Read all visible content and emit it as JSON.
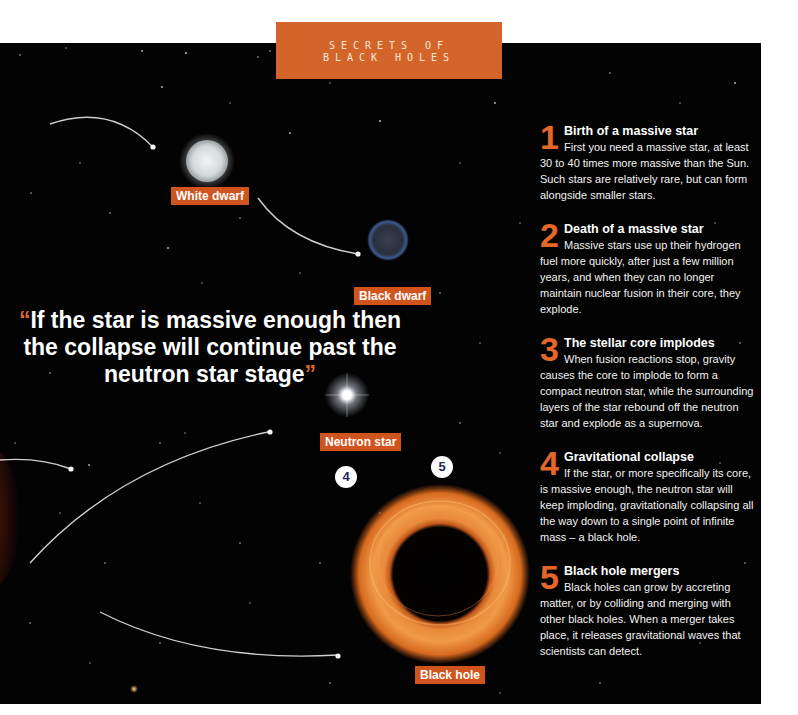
{
  "header": {
    "line1": "SECRETS OF",
    "line2": "BLACK HOLES"
  },
  "labels": {
    "white_dwarf": "White dwarf",
    "black_dwarf": "Black dwarf",
    "neutron_star": "Neutron star",
    "black_hole": "Black hole"
  },
  "quote": {
    "open": "“",
    "text": "If the star is massive enough then the collapse will continue past the neutron star stage",
    "close": "”"
  },
  "badges": [
    "4",
    "5"
  ],
  "steps": [
    {
      "number": "1",
      "title": "Birth of a massive star",
      "body": "First you need a massive star, at least 30 to 40 times more massive than the Sun. Such stars are relatively rare, but can form alongside smaller stars."
    },
    {
      "number": "2",
      "title": "Death of a massive star",
      "body": "Massive stars use up their hydrogen fuel more quickly, after just a few million years, and when they can no longer maintain nuclear fusion in their core, they explode."
    },
    {
      "number": "3",
      "title": "The stellar core implodes",
      "body": "When fusion reactions stop, gravity causes the core to implode to form a compact neutron star, while the surrounding layers of the star rebound off the neutron star and explode as a supernova."
    },
    {
      "number": "4",
      "title": "Gravitational collapse",
      "body": "If the star, or more specifically its core, is massive enough, the neutron star will keep imploding, gravitationally collapsing all the way down to a single point of infinite mass – a black hole."
    },
    {
      "number": "5",
      "title": "Black hole mergers",
      "body": "Black holes can grow by accreting matter, or by colliding and merging with other black holes. When a merger takes place, it releases gravitational waves that scientists can detect."
    }
  ],
  "colors": {
    "accent": "#d0541e",
    "background": "#030303",
    "badge_text": "#1f2a55"
  }
}
